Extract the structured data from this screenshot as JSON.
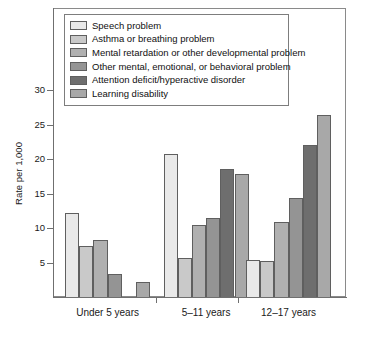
{
  "chart_data": {
    "type": "bar",
    "title": "",
    "subtitle": "",
    "xlabel": "",
    "ylabel": "Rate per 1,000",
    "ylim": [
      0,
      30
    ],
    "yticks": [
      0,
      5,
      10,
      15,
      20,
      25,
      30
    ],
    "ytick_labels": [
      "",
      "5",
      "10",
      "15",
      "20",
      "25",
      "30"
    ],
    "grid": false,
    "legend_position": "top-inside",
    "categories": [
      "Under 5 years",
      "5–11 years",
      "12–17 years"
    ],
    "series": [
      {
        "name": "Speech problem",
        "color": "#e9e9e9",
        "values": [
          12.2,
          20.7,
          5.3
        ]
      },
      {
        "name": "Asthma or breathing problem",
        "color": "#c9c9c9",
        "values": [
          7.4,
          5.6,
          5.2
        ]
      },
      {
        "name": "Mental retardation or other developmental problem",
        "color": "#b0b0b0",
        "values": [
          8.3,
          10.4,
          10.9
        ]
      },
      {
        "name": "Other mental, emotional, or behavioral problem",
        "color": "#949494",
        "values": [
          3.4,
          11.5,
          14.3
        ]
      },
      {
        "name": "Attention deficit/hyperactive disorder",
        "color": "#6e6e6e",
        "values": [
          0,
          18.5,
          22.0
        ]
      },
      {
        "name": "Learning disability",
        "color": "#a8a8a8",
        "values": [
          2.2,
          17.8,
          26.4
        ]
      }
    ]
  },
  "axes": {
    "y_title": "Rate per 1,000"
  }
}
